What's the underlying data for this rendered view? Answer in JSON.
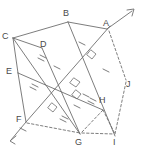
{
  "figure": {
    "width": 143,
    "height": 152,
    "background": "#ffffff",
    "stroke_color": "#6e6e6e",
    "label_color": "#4a4a4a",
    "points": {
      "A": {
        "label": "A",
        "x": 107,
        "y": 29,
        "label_x": 103,
        "label_y": 19
      },
      "B": {
        "label": "B",
        "x": 68,
        "y": 22,
        "label_x": 63,
        "label_y": 9
      },
      "C": {
        "label": "C",
        "x": 13,
        "y": 38,
        "label_x": 3,
        "label_y": 32
      },
      "D": {
        "label": "D",
        "x": 42,
        "y": 48,
        "label_x": 40,
        "label_y": 40
      },
      "E": {
        "label": "E",
        "x": 18,
        "y": 73,
        "label_x": 7,
        "label_y": 68
      },
      "F": {
        "label": "F",
        "x": 26,
        "y": 122,
        "label_x": 17,
        "label_y": 116
      },
      "G": {
        "label": "G",
        "x": 80,
        "y": 134,
        "label_x": 75,
        "label_y": 136
      },
      "H": {
        "label": "H",
        "x": 103,
        "y": 110,
        "label_x": 100,
        "label_y": 97
      },
      "I": {
        "label": "I",
        "x": 115,
        "y": 136,
        "label_x": 114,
        "label_y": 136
      },
      "J": {
        "label": "J",
        "x": 126,
        "y": 82,
        "label_x": 126,
        "label_y": 81
      }
    },
    "ray_arrow_top_right": {
      "name": "ray-arrowhead-top-right",
      "x": 133,
      "y": 10
    },
    "ray_arrow_bottom_left": {
      "name": "ray-arrowhead-bottom-left",
      "x": 10,
      "y": 141
    },
    "solid_segments": [
      "C-B",
      "B-A",
      "C-D",
      "C-E",
      "D-E",
      "E-F",
      "B-I",
      "A-F",
      "C-G",
      "E-H",
      "D-G"
    ],
    "dashed_segments": [
      "A-J",
      "J-I",
      "A-I",
      "H-I",
      "F-G",
      "G-I",
      "F-I"
    ],
    "tick_marks": {
      "single": 6,
      "double": 4,
      "description": "congruence hatch marks on segments"
    },
    "right_angle_marks": 4
  }
}
